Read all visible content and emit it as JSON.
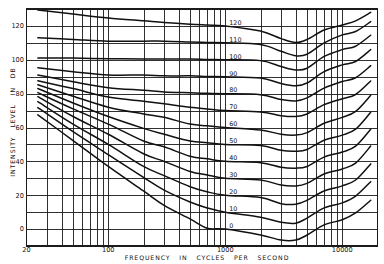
{
  "chart_data": {
    "type": "line",
    "title": "",
    "xlabel": "FREQUENCY IN CYCLES PER SECOND",
    "ylabel": "INTENSITY LEVEL IN DB",
    "xscale": "log",
    "xlim": [
      20,
      20000
    ],
    "ylim": [
      -10,
      130
    ],
    "grid": true,
    "legend_position": "inline labels near 1000 Hz",
    "x_ticks": [
      {
        "value": 20,
        "label": "20"
      },
      {
        "value": 100,
        "label": "100"
      },
      {
        "value": 1000,
        "label": "1000"
      },
      {
        "value": 10000,
        "label": "10000"
      }
    ],
    "y_ticks": [
      {
        "value": 0,
        "label": "0"
      },
      {
        "value": 20,
        "label": "20"
      },
      {
        "value": 40,
        "label": "40"
      },
      {
        "value": 60,
        "label": "60"
      },
      {
        "value": 80,
        "label": "80"
      },
      {
        "value": 100,
        "label": "100"
      },
      {
        "value": 120,
        "label": "120"
      }
    ],
    "x": [
      25,
      50,
      100,
      200,
      300,
      500,
      700,
      1000,
      2000,
      3000,
      4000,
      5000,
      7000,
      10000,
      13000,
      17500
    ],
    "series": [
      {
        "name": "120",
        "values": [
          129.4,
          127,
          124.7,
          123,
          122,
          121,
          120.5,
          120,
          117,
          112.5,
          110.2,
          112,
          117.6,
          120.6,
          123,
          128
        ]
      },
      {
        "name": "110",
        "values": [
          113,
          112,
          111,
          111,
          111,
          110.5,
          110.2,
          110,
          109,
          105,
          102.4,
          103.3,
          110,
          114.7,
          116.7,
          122.5
        ]
      },
      {
        "name": "100",
        "values": [
          101,
          101,
          100.6,
          100.5,
          100.5,
          100.5,
          100.2,
          100,
          99.5,
          96,
          94,
          95,
          102,
          106,
          108,
          114.5
        ]
      },
      {
        "name": "90",
        "values": [
          95.3,
          93,
          91,
          91,
          90.5,
          90.5,
          90.2,
          90,
          89.2,
          86,
          84.7,
          86.3,
          93,
          97,
          99,
          106
        ]
      },
      {
        "name": "80",
        "values": [
          91,
          87,
          83.5,
          82,
          81,
          80.5,
          80.2,
          80,
          79.4,
          76.5,
          75.7,
          77.5,
          83.3,
          87.2,
          89.4,
          96.5
        ]
      },
      {
        "name": "70",
        "values": [
          87.6,
          83,
          78,
          75.5,
          74,
          72,
          71,
          70,
          69.2,
          67,
          66.5,
          68,
          73.5,
          77,
          79.5,
          87.5
        ]
      },
      {
        "name": "60",
        "values": [
          85.3,
          78.5,
          72,
          68,
          66,
          62,
          61,
          60,
          58.5,
          56,
          55.5,
          57,
          62.5,
          66,
          69.5,
          79
        ]
      },
      {
        "name": "50",
        "values": [
          83,
          74.5,
          66.5,
          59.5,
          56,
          52,
          51,
          50,
          49.4,
          46.5,
          46,
          47,
          52.5,
          55.5,
          59,
          69
        ]
      },
      {
        "name": "40",
        "values": [
          80.6,
          71,
          62,
          52,
          48.6,
          43,
          41.5,
          40,
          39.2,
          36.5,
          36,
          37,
          42.5,
          45.5,
          49,
          59
        ]
      },
      {
        "name": "30",
        "values": [
          78.2,
          66.5,
          56,
          44.5,
          40,
          34,
          32,
          30,
          29,
          26,
          25.5,
          27,
          32.5,
          35.5,
          39,
          49
        ]
      },
      {
        "name": "20",
        "values": [
          75.3,
          62,
          50,
          37,
          31.6,
          25,
          22,
          20,
          18.6,
          15,
          14.7,
          17,
          22.5,
          25.5,
          29,
          38.5
        ]
      },
      {
        "name": "10",
        "values": [
          71.8,
          57.5,
          44,
          30.5,
          23,
          16,
          12.5,
          10,
          7,
          4,
          3.5,
          6.5,
          12.5,
          15.5,
          19.5,
          28
        ]
      },
      {
        "name": "0",
        "values": [
          67.5,
          52.3,
          37,
          22.5,
          14,
          6,
          0.5,
          0,
          -3.5,
          -6.5,
          -6.5,
          -3.5,
          2.5,
          5.5,
          9.5,
          17
        ]
      }
    ],
    "colors": {
      "background": "#ffffff",
      "lines": "#111111"
    }
  }
}
